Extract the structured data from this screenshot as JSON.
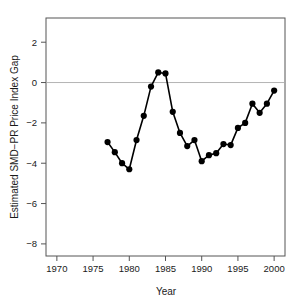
{
  "chart_data": {
    "type": "line",
    "title": "",
    "xlabel": "Year",
    "ylabel": "Estimated SMD−PR Price Index Gap",
    "xlim": [
      1968.5,
      2001.5
    ],
    "ylim": [
      -8.6,
      3.2
    ],
    "xticks": [
      1970,
      1975,
      1980,
      1985,
      1990,
      1995,
      2000
    ],
    "xtick_labels": [
      "1970",
      "1975",
      "1980",
      "1985",
      "1990",
      "1995",
      "2000"
    ],
    "yticks": [
      2,
      0,
      -2,
      -4,
      -6,
      -8
    ],
    "ytick_labels": [
      "2",
      "0",
      "−2",
      "−4",
      "−6",
      "−8"
    ],
    "grid": false,
    "legend": null,
    "reference_lines": [
      {
        "axis": "y",
        "value": 0,
        "color": "#b4b4b4",
        "style": "solid"
      }
    ],
    "marker": "filled-circle",
    "marker_color": "#000000",
    "line_color": "#000000",
    "x": [
      1977,
      1978,
      1979,
      1980,
      1981,
      1982,
      1983,
      1984,
      1985,
      1986,
      1987,
      1988,
      1989,
      1990,
      1991,
      1992,
      1993,
      1994,
      1995,
      1996,
      1997,
      1998,
      1999,
      2000
    ],
    "values": [
      -2.95,
      -3.45,
      -4.0,
      -4.3,
      -2.85,
      -1.65,
      -0.2,
      0.5,
      0.45,
      -1.45,
      -2.5,
      -3.15,
      -2.85,
      -3.9,
      -3.6,
      -3.5,
      -3.05,
      -3.1,
      -2.25,
      -2.0,
      -1.05,
      -1.5,
      -1.05,
      -0.4
    ],
    "points": [
      {
        "x": 1977,
        "y": -2.95
      },
      {
        "x": 1978,
        "y": -3.45
      },
      {
        "x": 1979,
        "y": -4.0
      },
      {
        "x": 1980,
        "y": -4.3
      },
      {
        "x": 1981,
        "y": -2.85
      },
      {
        "x": 1982,
        "y": -1.65
      },
      {
        "x": 1983,
        "y": -0.2
      },
      {
        "x": 1984,
        "y": 0.5
      },
      {
        "x": 1985,
        "y": 0.45
      },
      {
        "x": 1986,
        "y": -1.45
      },
      {
        "x": 1987,
        "y": -2.5
      },
      {
        "x": 1988,
        "y": -3.15
      },
      {
        "x": 1989,
        "y": -2.85
      },
      {
        "x": 1990,
        "y": -3.9
      },
      {
        "x": 1991,
        "y": -3.6
      },
      {
        "x": 1992,
        "y": -3.5
      },
      {
        "x": 1993,
        "y": -3.05
      },
      {
        "x": 1994,
        "y": -3.1
      },
      {
        "x": 1995,
        "y": -2.25
      },
      {
        "x": 1996,
        "y": -2.0
      },
      {
        "x": 1997,
        "y": -1.05
      },
      {
        "x": 1998,
        "y": -1.5
      },
      {
        "x": 1999,
        "y": -1.05
      },
      {
        "x": 2000,
        "y": -0.4
      }
    ]
  },
  "axes": {
    "x_axis_title": "Year",
    "y_axis_title": "Estimated SMD−PR Price Index Gap"
  }
}
